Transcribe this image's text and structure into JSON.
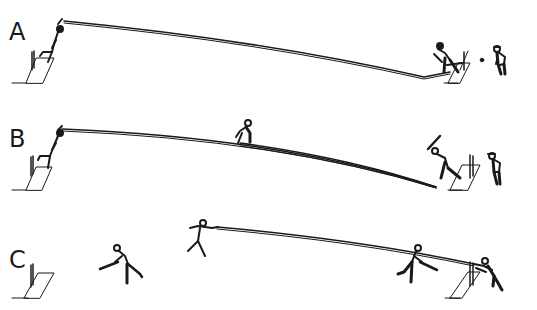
{
  "diagram": {
    "panels": [
      {
        "id": "A",
        "label": "A",
        "description": "Bowler delivers; ball bounces near batsman's crease and passes to wicket-keeper"
      },
      {
        "id": "B",
        "label": "B",
        "description": "Bowler delivers; fielder at mid-pitch; two trajectories converge near batsman"
      },
      {
        "id": "C",
        "label": "C",
        "description": "Fielder throws ball to wicket; batsmen running between creases; keeper at stumps"
      }
    ],
    "colors": {
      "line": "#1a1a1a",
      "background": "#ffffff"
    }
  }
}
